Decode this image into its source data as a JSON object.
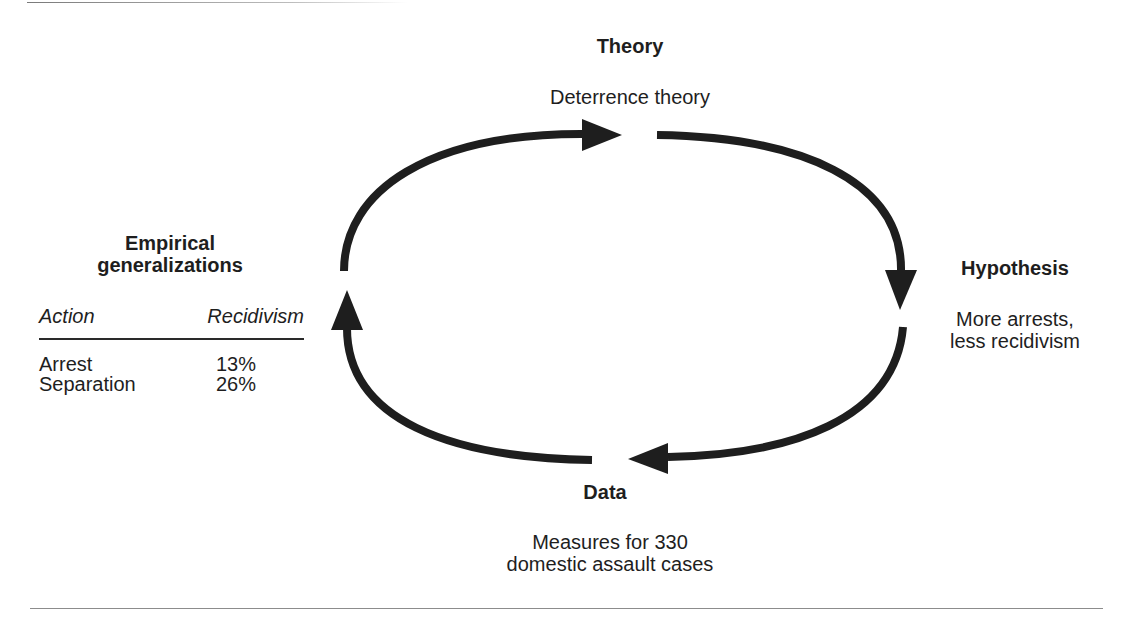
{
  "diagram": {
    "type": "cycle",
    "direction": "clockwise",
    "nodes": [
      {
        "id": "theory",
        "title": "Theory",
        "description": [
          "Deterrence theory"
        ]
      },
      {
        "id": "hypothesis",
        "title": "Hypothesis",
        "description": [
          "More arrests,",
          "less recidivism"
        ]
      },
      {
        "id": "data",
        "title": "Data",
        "description": [
          "Measures for 330",
          "domestic assault cases"
        ]
      },
      {
        "id": "empirical",
        "title": [
          "Empirical",
          "generalizations"
        ]
      }
    ],
    "edges": [
      {
        "from": "empirical",
        "to": "theory"
      },
      {
        "from": "theory",
        "to": "hypothesis"
      },
      {
        "from": "hypothesis",
        "to": "data"
      },
      {
        "from": "data",
        "to": "empirical"
      }
    ]
  },
  "theory": {
    "title": "Theory",
    "description": "Deterrence theory"
  },
  "hypothesis": {
    "title": "Hypothesis",
    "line1": "More arrests,",
    "line2": "less recidivism"
  },
  "data": {
    "title": "Data",
    "line1": "Measures for 330",
    "line2": "domestic assault cases"
  },
  "empirical": {
    "title_line1": "Empirical",
    "title_line2": "generalizations",
    "table": {
      "headers": [
        "Action",
        "Recidivism"
      ],
      "rows": [
        [
          "Arrest",
          "13%"
        ],
        [
          "Separation",
          "26%"
        ]
      ]
    }
  },
  "colors": {
    "ink": "#1e1e1e",
    "rule": "#8c8c8c",
    "background": "#ffffff"
  },
  "icons": {
    "arrow": "curved-arrow"
  }
}
